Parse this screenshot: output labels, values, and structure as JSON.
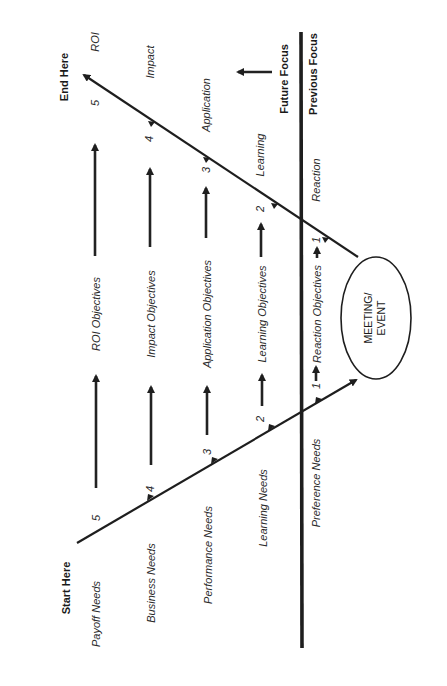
{
  "diagram": {
    "orientation": "rotated-90-ccw",
    "start_label": "Start Here",
    "end_label": "End Here",
    "center_event": {
      "line1": "MEETING/",
      "line2": "EVENT"
    },
    "needs": [
      {
        "level": "5",
        "label": "Payoff Needs"
      },
      {
        "level": "4",
        "label": "Business Needs"
      },
      {
        "level": "3",
        "label": "Performance Needs"
      },
      {
        "level": "2",
        "label": "Learning Needs"
      },
      {
        "level": "1",
        "label": "Preference Needs"
      }
    ],
    "objectives": [
      {
        "label": "ROI Objectives"
      },
      {
        "label": "Impact Objectives"
      },
      {
        "label": "Application Objectives"
      },
      {
        "label": "Learning Objectives"
      },
      {
        "label": "Reaction Objectives"
      }
    ],
    "evaluation": [
      {
        "level": "5",
        "label": "ROI"
      },
      {
        "level": "4",
        "label": "Impact"
      },
      {
        "level": "3",
        "label": "Application"
      },
      {
        "level": "2",
        "label": "Learning"
      },
      {
        "level": "1",
        "label": "Reaction"
      }
    ],
    "future_focus": "Future Focus",
    "previous_focus": "Previous Focus",
    "colors": {
      "ink": "#1e1e1e",
      "background": "#ffffff"
    }
  }
}
